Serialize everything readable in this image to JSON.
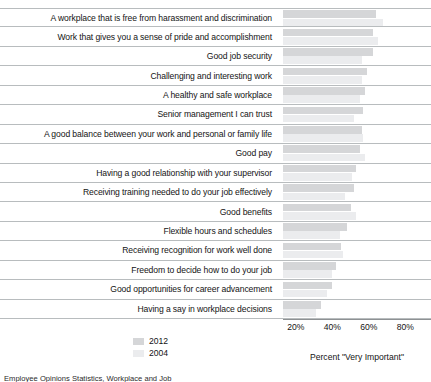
{
  "chart_data": {
    "type": "bar",
    "orientation": "horizontal",
    "title": "",
    "xlabel": "Percent \"Very Important\"",
    "ylabel": "",
    "xlim": [
      13,
      94
    ],
    "xticks": [
      "20%",
      "40%",
      "60%",
      "80%"
    ],
    "xtick_values": [
      20,
      40,
      60,
      80
    ],
    "grid": false,
    "legend_position": "bottom-left",
    "categories": [
      "A workplace that is free from harassment and discrimination",
      "Work that gives you a sense of pride and accomplishment",
      "Good job security",
      "Challenging and interesting work",
      "A healthy and safe workplace",
      "Senior management I can trust",
      "A good balance between your work and personal or family life",
      "Good pay",
      "Having a good relationship with your supervisor",
      "Receiving training needed to do your job effectively",
      "Good benefits",
      "Flexible hours and schedules",
      "Receiving recognition for work well done",
      "Freedom to decide how to do your job",
      "Good opportunities for career advancement",
      "Having a say in workplace decisions"
    ],
    "series": [
      {
        "name": "2012",
        "color": "#d5d6d8",
        "values": [
          64,
          62,
          62,
          59,
          58,
          57,
          56,
          55,
          53,
          52,
          50,
          48,
          45,
          42,
          40,
          34
        ]
      },
      {
        "name": "2004",
        "color": "#ebecee",
        "values": [
          68,
          65,
          56,
          56,
          55,
          52,
          57,
          58,
          51,
          47,
          53,
          44,
          46,
          40,
          37,
          31
        ]
      }
    ]
  },
  "legend": {
    "entries": [
      {
        "label": "2012",
        "color": "#d5d6d8"
      },
      {
        "label": "2004",
        "color": "#ebecee"
      }
    ]
  },
  "axis": {
    "title": "Percent \"Very Important\""
  },
  "caption": {
    "text": "Employee Opinions Statistics, Workplace and Job"
  }
}
